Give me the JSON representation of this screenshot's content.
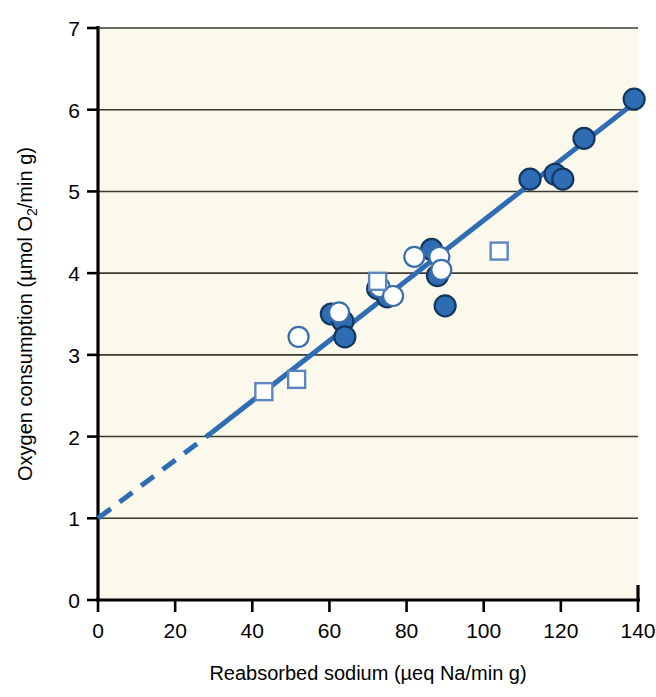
{
  "chart_data": {
    "type": "scatter",
    "title": "",
    "xlabel": "Reabsorbed sodium (µeq Na/min g)",
    "ylabel": "Oxygen consumption (µmol O₂/min g)",
    "ylabel_parts": {
      "pre": "Oxygen consumption (µmol O",
      "sub": "2",
      "post": "/min g)"
    },
    "xlim": [
      0,
      140
    ],
    "ylim": [
      0,
      7
    ],
    "xticks": [
      0,
      20,
      40,
      60,
      80,
      100,
      120,
      140
    ],
    "yticks": [
      0,
      1,
      2,
      3,
      4,
      5,
      6,
      7
    ],
    "xtick_labels": [
      "0",
      "20",
      "40",
      "60",
      "80",
      "100",
      "120",
      "140"
    ],
    "ytick_labels": [
      "0",
      "1",
      "2",
      "3",
      "4",
      "5",
      "6",
      "7"
    ],
    "grid": "horizontal",
    "grid_values": [
      1,
      2,
      3,
      4,
      5,
      6
    ],
    "legend": "none",
    "accent_color": "#2E6DB4",
    "plot_background": "#FBF9EC",
    "axis_color": "#000000",
    "grid_color": "#3A3A30",
    "series": [
      {
        "name": "filled-circle",
        "marker": "filled-circle",
        "fill": "#2E6DB4",
        "stroke": "#13375F",
        "points": [
          [
            60.5,
            3.5
          ],
          [
            63.5,
            3.41
          ],
          [
            64.0,
            3.22
          ],
          [
            72.5,
            3.81
          ],
          [
            75.0,
            3.71
          ],
          [
            86.5,
            4.29
          ],
          [
            88.0,
            3.97
          ],
          [
            90.0,
            3.6
          ],
          [
            112.0,
            5.15
          ],
          [
            118.5,
            5.21
          ],
          [
            120.5,
            5.15
          ],
          [
            126.0,
            5.65
          ],
          [
            139.0,
            6.13
          ]
        ]
      },
      {
        "name": "open-circle",
        "marker": "open-circle",
        "fill": "#FFFFFF",
        "stroke": "#3A6FA8",
        "points": [
          [
            52.0,
            3.22
          ],
          [
            62.5,
            3.52
          ],
          [
            73.0,
            3.83
          ],
          [
            76.5,
            3.72
          ],
          [
            82.0,
            4.2
          ],
          [
            88.5,
            4.2
          ],
          [
            89.0,
            4.04
          ]
        ]
      },
      {
        "name": "open-square",
        "marker": "open-square",
        "fill": "#FFFFFF",
        "stroke": "#5C86BE",
        "points": [
          [
            43.0,
            2.55
          ],
          [
            51.5,
            2.7
          ],
          [
            72.5,
            3.9
          ],
          [
            104.0,
            4.27
          ]
        ]
      }
    ],
    "fit_line": {
      "name": "regression-line",
      "color": "#2E6DB4",
      "width": 5,
      "solid_segment": [
        [
          29.5,
          2.05
        ],
        [
          140.0,
          6.12
        ]
      ],
      "dashed_segment": [
        [
          0.0,
          1.0
        ],
        [
          29.5,
          2.05
        ]
      ],
      "intercept": 1.0,
      "slope": 0.0366
    }
  }
}
